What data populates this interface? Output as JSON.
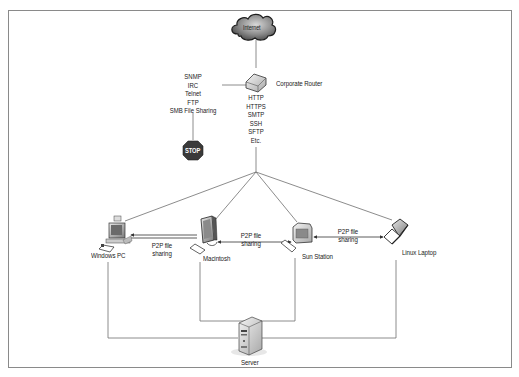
{
  "diagram": {
    "type": "network-topology",
    "nodes": {
      "internet": {
        "label": "Internet"
      },
      "router": {
        "label": "Corporate Router"
      },
      "stop": {
        "label": "STOP"
      },
      "windows_pc": {
        "label": "Windows PC"
      },
      "macintosh": {
        "label": "Macintosh"
      },
      "sun_station": {
        "label": "Sun Station"
      },
      "linux_laptop": {
        "label": "Linux Laptop"
      },
      "server": {
        "label": "Server"
      }
    },
    "blocked_protocols": [
      "SNMP",
      "IRC",
      "Telnet",
      "FTP",
      "SMB File Sharing"
    ],
    "allowed_protocols": [
      "HTTP",
      "HTTPS",
      "SMTP",
      "SSH",
      "SFTP",
      "Etc."
    ],
    "p2p_links": [
      {
        "from": "windows_pc",
        "to": "macintosh",
        "label_line1": "P2P file",
        "label_line2": "sharing"
      },
      {
        "from": "macintosh",
        "to": "sun_station",
        "label_line1": "P2P file",
        "label_line2": "sharing"
      },
      {
        "from": "sun_station",
        "to": "linux_laptop",
        "label_line1": "P2P file",
        "label_line2": "sharing"
      }
    ],
    "colors": {
      "line": "#6e6e6e",
      "frame": "#8a8a8a",
      "stop_sign": "#3a3a3a",
      "cloud_dark": "#3c3c3c",
      "cloud_light": "#bdbdbd"
    }
  }
}
